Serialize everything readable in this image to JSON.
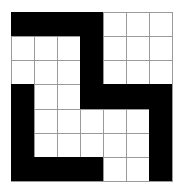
{
  "puzzle": {
    "rows": 7,
    "cols": 7,
    "colors": {
      "filled": "#000000",
      "empty": "#ffffff",
      "gridline": "#9a9a9a"
    },
    "cells": [
      [
        1,
        1,
        1,
        1,
        0,
        0,
        0
      ],
      [
        0,
        0,
        0,
        1,
        0,
        0,
        0
      ],
      [
        0,
        0,
        0,
        1,
        0,
        0,
        0
      ],
      [
        1,
        0,
        0,
        1,
        1,
        1,
        1
      ],
      [
        1,
        0,
        0,
        0,
        0,
        0,
        1
      ],
      [
        1,
        0,
        0,
        0,
        0,
        0,
        1
      ],
      [
        1,
        1,
        1,
        1,
        0,
        0,
        1
      ]
    ]
  }
}
